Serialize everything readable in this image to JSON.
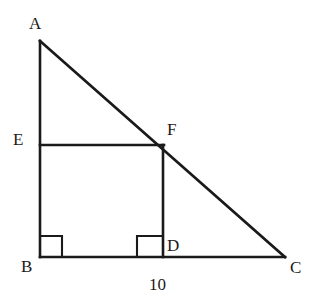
{
  "figure": {
    "type": "geometry-diagram",
    "stroke_color": "#1a1a1a",
    "background_color": "#ffffff",
    "points": {
      "A": {
        "label": "A",
        "x": 40,
        "y": 41
      },
      "B": {
        "label": "B",
        "x": 40,
        "y": 257
      },
      "C": {
        "label": "C",
        "x": 285,
        "y": 257
      },
      "D": {
        "label": "D",
        "x": 163,
        "y": 257
      },
      "E": {
        "label": "E",
        "x": 40,
        "y": 145
      },
      "F": {
        "label": "F",
        "x": 163,
        "y": 146
      }
    },
    "segments": [
      {
        "name": "AB",
        "from": "A",
        "to": "B"
      },
      {
        "name": "BC",
        "from": "B",
        "to": "C"
      },
      {
        "name": "AC",
        "from": "A",
        "to": "C"
      },
      {
        "name": "EF",
        "from": "E",
        "to": "F"
      },
      {
        "name": "FD",
        "from": "F",
        "to": "D"
      }
    ],
    "right_angles": [
      {
        "at": "B",
        "label": "right-angle-mark-B"
      },
      {
        "at": "D",
        "label": "right-angle-mark-D"
      }
    ],
    "measurements": [
      {
        "segment": "BC",
        "value": "10",
        "position": "below"
      }
    ]
  }
}
